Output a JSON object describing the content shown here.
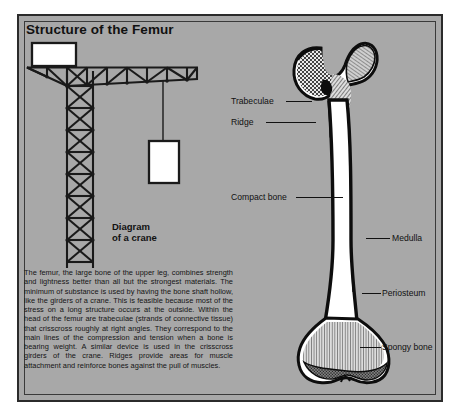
{
  "figure": {
    "title": "Structure of the Femur",
    "crane_caption_line1": "Diagram",
    "crane_caption_line2": "of a crane",
    "body_text": "The femur, the large bone of the upper leg, combines strength and lightness better than all but the strongest materials. The minimum of substance is used by having the bone shaft hollow, like the girders of a crane. This is feasible because most of the stress on a long structure occurs at the outside. Within the head of the femur are trabeculae (strands of connective tissue) that crisscross roughly at right angles. They correspond to the main lines of the compression and tension when a bone is bearing weight. A similar device is used in the crisscross girders of the crane. Ridges provide areas for muscle attachment and reinforce bones against the pull of muscles.",
    "labels": [
      {
        "id": "trabeculae",
        "text": "Trabeculae"
      },
      {
        "id": "ridge",
        "text": "Ridge"
      },
      {
        "id": "compact-bone",
        "text": "Compact bone"
      },
      {
        "id": "medulla",
        "text": "Medulla"
      },
      {
        "id": "periosteum",
        "text": "Periosteum"
      },
      {
        "id": "spongy-bone",
        "text": "Spongy bone"
      }
    ],
    "colors": {
      "plate_background": "#a8a8a8",
      "frame_border": "#2b2b2b",
      "ink": "#111111",
      "bone_fill": "#ffffff",
      "page_background": "#ffffff"
    }
  }
}
